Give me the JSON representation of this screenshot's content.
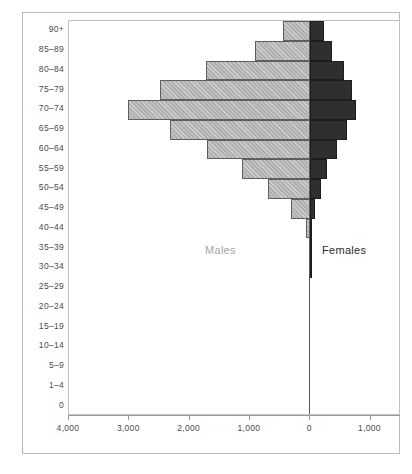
{
  "chart_data": {
    "type": "bar",
    "subtype": "population-pyramid",
    "title": "",
    "xlabel": "",
    "ylabel": "",
    "orientation": "horizontal",
    "grid": false,
    "legend_position": "inside-plot",
    "categories": [
      "0",
      "1–4",
      "5–9",
      "10–14",
      "15–19",
      "20–24",
      "25–29",
      "30–34",
      "35–39",
      "40–44",
      "45–49",
      "50–54",
      "55–59",
      "60–64",
      "65–69",
      "70–74",
      "75–79",
      "80–84",
      "85–89",
      "90+"
    ],
    "axis_ticks": [
      {
        "label": "4,000",
        "value": 4000
      },
      {
        "label": "3,000",
        "value": 3000
      },
      {
        "label": "2,000",
        "value": 2000
      },
      {
        "label": "1,000",
        "value": 1000
      },
      {
        "label": "0",
        "value": 0
      },
      {
        "label": "1,000",
        "value": 1000
      }
    ],
    "xlim_left": 4400,
    "xlim_right": 1500,
    "series": [
      {
        "name": "Males",
        "side": "left",
        "color": "#b0b0b0",
        "values": [
          0,
          0,
          0,
          0,
          0,
          0,
          0,
          10,
          20,
          60,
          310,
          700,
          1130,
          1700,
          2320,
          3020,
          2480,
          1720,
          920,
          440
        ]
      },
      {
        "name": "Females",
        "side": "right",
        "color": "#2f2f2f",
        "values": [
          0,
          0,
          0,
          0,
          0,
          0,
          0,
          5,
          10,
          25,
          80,
          175,
          290,
          450,
          620,
          760,
          700,
          560,
          370,
          230
        ]
      }
    ],
    "annotations": [
      {
        "name": "males-label",
        "text": "Males"
      },
      {
        "name": "females-label",
        "text": "Females"
      }
    ]
  }
}
